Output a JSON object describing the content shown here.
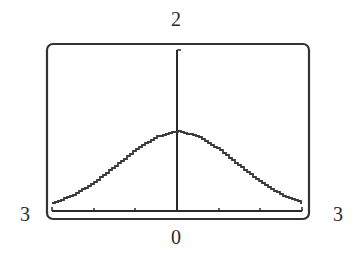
{
  "window": {
    "xmin_label": "3",
    "xmax_label": "3",
    "ymin_label": "0",
    "ymax_label": "2"
  },
  "colors": {
    "frame": "#333333",
    "axes": "#2a2a2a",
    "curve": "#3a3a3a",
    "background": "#ffffff"
  },
  "chart_data": {
    "type": "line",
    "title": "",
    "xlabel": "",
    "ylabel": "",
    "xlim": [
      -3,
      3
    ],
    "ylim": [
      0,
      2
    ],
    "x_tick_step": 1,
    "grid": false,
    "legend": null,
    "window_labels": {
      "left": "3",
      "right": "3",
      "bottom": "0",
      "top": "2"
    },
    "series": [
      {
        "name": "bell curve",
        "x": [
          -3,
          -2.5,
          -2,
          -1.5,
          -1,
          -0.5,
          0,
          0.5,
          1,
          1.5,
          2,
          2.5,
          3
        ],
        "y": [
          0.1,
          0.2,
          0.36,
          0.56,
          0.77,
          0.93,
          1.0,
          0.93,
          0.77,
          0.56,
          0.36,
          0.2,
          0.1
        ]
      }
    ]
  }
}
